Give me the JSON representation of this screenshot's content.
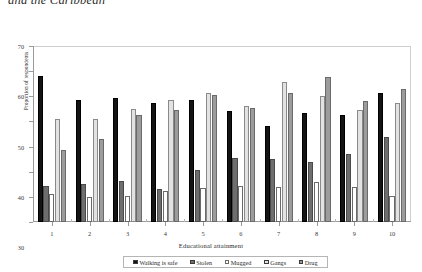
{
  "document": {
    "title_fragment": "and the Caribbean"
  },
  "axes": {
    "y_label": "Proportion of respondents",
    "x_label": "Educational attainment",
    "y_ticks": [
      0,
      10,
      20,
      30,
      40,
      50,
      60,
      70
    ],
    "x_ticks": [
      "1",
      "2",
      "3",
      "4",
      "5",
      "6",
      "7",
      "8",
      "9",
      "10"
    ]
  },
  "legend": {
    "items": [
      {
        "label": "Walking is safe",
        "color": "#141414",
        "swatch": "filled-black"
      },
      {
        "label": "Stolen",
        "color": "#6e6e6e",
        "swatch": "filled-dark-gray"
      },
      {
        "label": "Mugged",
        "color": "#ffffff",
        "swatch": "outline-white"
      },
      {
        "label": "Gangs",
        "color": "#e2e2e2",
        "swatch": "filled-light-gray"
      },
      {
        "label": "Drug",
        "color": "#9c9c9c",
        "swatch": "filled-mid-gray"
      }
    ]
  },
  "chart_data": {
    "type": "bar",
    "title": "",
    "xlabel": "Educational attainment",
    "ylabel": "Proportion of respondents",
    "ylim": [
      0,
      70
    ],
    "ytick_step": 10,
    "grid": false,
    "legend_position": "bottom",
    "categories": [
      "1",
      "2",
      "3",
      "4",
      "5",
      "6",
      "7",
      "8",
      "9",
      "10"
    ],
    "series": [
      {
        "name": "Walking is safe",
        "color": "#141414",
        "values": [
          58.0,
          48.5,
          49.5,
          47.5,
          48.5,
          44.0,
          38.0,
          43.5,
          42.5,
          51.5
        ]
      },
      {
        "name": "Stolen",
        "color": "#6e6e6e",
        "values": [
          14.5,
          15.0,
          16.5,
          13.0,
          20.5,
          25.5,
          25.0,
          24.0,
          27.0,
          34.0
        ]
      },
      {
        "name": "Mugged",
        "color": "#ffffff",
        "values": [
          11.0,
          10.0,
          10.5,
          12.5,
          13.5,
          14.5,
          14.0,
          16.0,
          14.0,
          10.5
        ]
      },
      {
        "name": "Gangs",
        "color": "#e2e2e2",
        "values": [
          41.0,
          41.0,
          45.0,
          48.5,
          51.5,
          46.0,
          55.5,
          50.0,
          44.5,
          47.5
        ]
      },
      {
        "name": "Drug",
        "color": "#9c9c9c",
        "values": [
          28.5,
          33.0,
          42.5,
          44.5,
          50.5,
          45.5,
          51.5,
          57.5,
          48.0,
          53.0
        ]
      }
    ]
  }
}
